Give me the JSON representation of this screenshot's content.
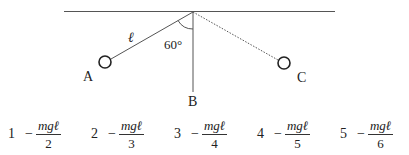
{
  "diagram": {
    "labels": {
      "A": "A",
      "B": "B",
      "C": "C",
      "length": "ℓ",
      "angle": "60°"
    },
    "colors": {
      "line": "#555555",
      "ink": "#222222"
    }
  },
  "choices": [
    {
      "number": "1",
      "sign": "−",
      "numerator": "mgℓ",
      "denominator": "2"
    },
    {
      "number": "2",
      "sign": "−",
      "numerator": "mgℓ",
      "denominator": "3"
    },
    {
      "number": "3",
      "sign": "−",
      "numerator": "mgℓ",
      "denominator": "4"
    },
    {
      "number": "4",
      "sign": "−",
      "numerator": "mgℓ",
      "denominator": "5"
    },
    {
      "number": "5",
      "sign": "−",
      "numerator": "mgℓ",
      "denominator": "6"
    }
  ]
}
